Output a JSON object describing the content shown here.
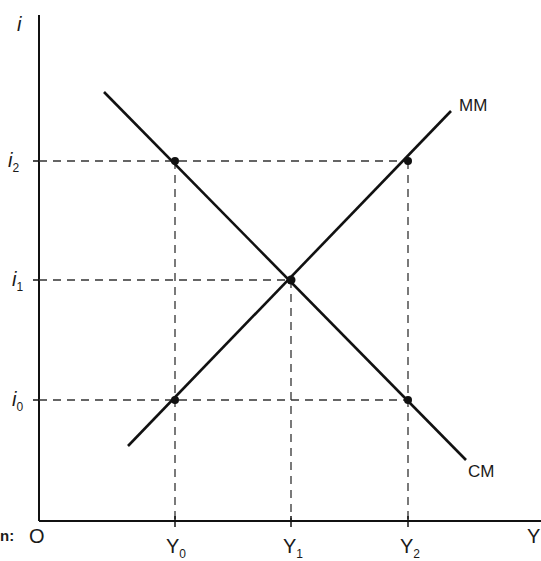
{
  "diagram": {
    "axes": {
      "y_axis_label": "i",
      "x_axis_label": "Y",
      "origin_label": "O",
      "corner_fragment": "n:"
    },
    "y_ticks": [
      {
        "base": "i",
        "sub": "2"
      },
      {
        "base": "i",
        "sub": "1"
      },
      {
        "base": "i",
        "sub": "0"
      }
    ],
    "x_ticks": [
      {
        "base": "Y",
        "sub": "0"
      },
      {
        "base": "Y",
        "sub": "1"
      },
      {
        "base": "Y",
        "sub": "2"
      }
    ],
    "curves": {
      "mm": "MM",
      "cm": "CM"
    },
    "colors": {
      "line": "#111111",
      "dash": "#333333",
      "background": "#ffffff"
    }
  }
}
